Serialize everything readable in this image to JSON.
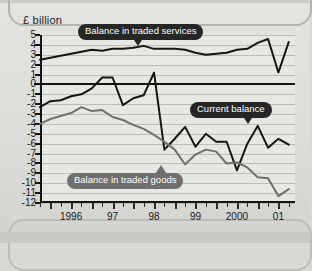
{
  "axis_title": "£ billion",
  "callouts": {
    "services": "Balance in traded services",
    "current": "Current balance",
    "goods": "Balance in traded goods"
  },
  "colors": {
    "services_line": "#151515",
    "current_line": "#151515",
    "goods_line": "#6f6f6f",
    "pill_dark": "#262626",
    "pill_grey": "#6f6f6f",
    "plot_background": "#e7e7e3",
    "gridline": "#bdbdb8",
    "page_background": "#dcdcd8"
  },
  "chart_data": {
    "type": "line",
    "title": "",
    "subtitle": "",
    "xlabel": "",
    "ylabel": "£ billion",
    "ylim": [
      -12,
      5
    ],
    "yticks": [
      5,
      4,
      3,
      2,
      1,
      0,
      -1,
      -2,
      -3,
      -4,
      -5,
      -6,
      -7,
      -8,
      -9,
      -10,
      -11,
      -12
    ],
    "ytick_labels": [
      "5",
      "4",
      "3",
      "2",
      "1",
      "0",
      "-1",
      "-2",
      "-3",
      "-4",
      "-5",
      "-6",
      "-7",
      "-8",
      "-9",
      "-10",
      "-11",
      "-12"
    ],
    "grid": true,
    "zero_line": true,
    "legend_position": "inline-callouts",
    "x_tick_labels": [
      "1996",
      "97",
      "98",
      "99",
      "2000",
      "01"
    ],
    "x_tick_positions": [
      1996.5,
      1997.5,
      1998.5,
      1999.5,
      2000.5,
      2001.5
    ],
    "xlim": [
      1995.75,
      2001.9
    ],
    "x_minor_interval": 0.25,
    "x": [
      1995.75,
      1996.0,
      1996.25,
      1996.5,
      1996.75,
      1997.0,
      1997.25,
      1997.5,
      1997.75,
      1998.0,
      1998.25,
      1998.5,
      1998.75,
      1999.0,
      1999.25,
      1999.5,
      1999.75,
      2000.0,
      2000.25,
      2000.5,
      2000.75,
      2001.0,
      2001.25,
      2001.5,
      2001.75
    ],
    "series": [
      {
        "name": "Balance in traded services",
        "color": "#151515",
        "values": [
          2.5,
          2.7,
          2.9,
          3.1,
          3.3,
          3.5,
          3.4,
          3.6,
          3.6,
          3.7,
          3.9,
          3.6,
          3.6,
          3.6,
          3.5,
          3.2,
          3.0,
          3.1,
          3.2,
          3.5,
          3.6,
          4.2,
          4.6,
          1.2,
          4.3
        ]
      },
      {
        "name": "Current balance",
        "color": "#151515",
        "values": [
          -2.3,
          -1.7,
          -1.6,
          -1.2,
          -1.0,
          -0.4,
          0.7,
          0.7,
          -2.1,
          -1.4,
          -1.1,
          1.2,
          -6.6,
          -5.5,
          -4.3,
          -6.3,
          -5.0,
          -5.8,
          -5.8,
          -8.7,
          -6.0,
          -4.2,
          -6.4,
          -5.5,
          -6.1
        ]
      },
      {
        "name": "Balance in traded goods",
        "color": "#6f6f6f",
        "values": [
          -4.0,
          -3.5,
          -3.2,
          -2.9,
          -2.3,
          -2.7,
          -2.6,
          -3.3,
          -3.6,
          -4.1,
          -4.5,
          -5.1,
          -5.8,
          -6.6,
          -8.1,
          -7.1,
          -6.6,
          -6.8,
          -8.0,
          -7.9,
          -8.4,
          -9.4,
          -9.5,
          -11.3,
          -10.6
        ]
      }
    ]
  }
}
